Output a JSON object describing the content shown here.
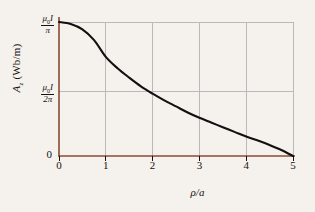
{
  "chart_data": {
    "type": "line",
    "title": "",
    "subtitle": "",
    "xlabel": "ρ/a",
    "ylabel": "A_z (Wb/m)",
    "xlim": [
      0,
      5
    ],
    "ylim": [
      0,
      1
    ],
    "grid": true,
    "legend": false,
    "x_ticks": [
      "0",
      "1",
      "2",
      "3",
      "4",
      "5"
    ],
    "x_tick_values": [
      0,
      1,
      2,
      3,
      4,
      5
    ],
    "y_ticks": [
      "0",
      "μ₀I/2π",
      "μ₀I/π"
    ],
    "y_tick_values": [
      0,
      0.5,
      1.0
    ],
    "x": [
      0,
      0.25,
      0.5,
      0.75,
      1.0,
      1.25,
      1.5,
      1.75,
      2.0,
      2.25,
      2.5,
      2.75,
      3.0,
      3.25,
      3.5,
      3.75,
      4.0,
      4.25,
      4.5,
      4.75,
      5.0
    ],
    "y": [
      1.0,
      0.985,
      0.945,
      0.865,
      0.74,
      0.655,
      0.585,
      0.52,
      0.465,
      0.415,
      0.37,
      0.325,
      0.285,
      0.25,
      0.215,
      0.18,
      0.145,
      0.115,
      0.082,
      0.045,
      0.0
    ],
    "series": [
      {
        "name": "Az",
        "values": [
          1.0,
          0.985,
          0.945,
          0.865,
          0.74,
          0.655,
          0.585,
          0.52,
          0.465,
          0.415,
          0.37,
          0.325,
          0.285,
          0.25,
          0.215,
          0.18,
          0.145,
          0.115,
          0.082,
          0.045,
          0.0
        ]
      }
    ],
    "colors": {
      "curve": "#111111",
      "axis": "#8b4a30",
      "grid": "#b9b9b9",
      "background": "#f5f2ed",
      "text": "#15110f"
    }
  },
  "axes": {
    "y_title": {
      "symbol": "A",
      "subscript": "z",
      "units": "(Wb/m)"
    },
    "x_title": "ρ/a",
    "y_labels": {
      "top": {
        "numerator_mu": "μ",
        "numerator_sub": "0",
        "numerator_I": "I",
        "denominator": "π"
      },
      "mid": {
        "numerator_mu": "μ",
        "numerator_sub": "0",
        "numerator_I": "I",
        "denominator": "2π"
      },
      "bottom": "0"
    },
    "x_labels": [
      "0",
      "1",
      "2",
      "3",
      "4",
      "5"
    ]
  }
}
